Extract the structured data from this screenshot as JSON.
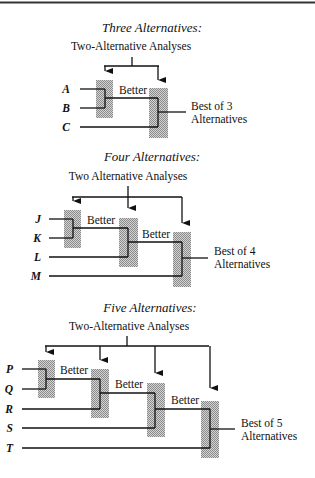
{
  "figure": {
    "width": 315,
    "height": 478,
    "top_rule": {
      "x1": 0,
      "x2": 315,
      "y": 2.5
    },
    "colors": {
      "line": "#111111",
      "shade": "#b8b8b8",
      "shade_dot": "#8a8a8a",
      "background": "#ffffff"
    }
  },
  "sections": [
    {
      "title": "Three Alternatives:",
      "title_pos": {
        "x": 152,
        "y": 32
      },
      "subtitle": "Two-Alternative Analyses",
      "subtitle_pos": {
        "x": 131,
        "y": 50
      },
      "stem": {
        "x": 132,
        "y1": 57,
        "y2": 66
      },
      "bus": {
        "x1": 104,
        "x2": 159,
        "y": 66
      },
      "inputs": [
        {
          "label": "A",
          "y": 89,
          "label_x": 70,
          "line_x1": 80
        },
        {
          "label": "B",
          "y": 108,
          "label_x": 70,
          "line_x1": 80
        },
        {
          "label": "C",
          "y": 127,
          "label_x": 70,
          "line_x1": 80
        }
      ],
      "comparators": [
        {
          "box": {
            "x": 96,
            "y": 80,
            "w": 17,
            "h": 38
          },
          "vx": 105,
          "top_y": 89,
          "bottom_y": 108,
          "out_y": 98,
          "arrow_tip_y": 78,
          "better_label": "Better",
          "better_pos": {
            "x": 119,
            "y": 94
          }
        },
        {
          "box": {
            "x": 149,
            "y": 88,
            "w": 19,
            "h": 50
          },
          "vx": 158,
          "top_y": 98,
          "bottom_y": 127,
          "out_y": 112,
          "arrow_tip_y": 87
        }
      ],
      "output": {
        "x2": 186,
        "label_line1": "Best of 3",
        "label_line2": "Alternatives",
        "label_x": 191,
        "label_y1": 110,
        "label_y2": 123
      }
    },
    {
      "title": "Four Alternatives:",
      "title_pos": {
        "x": 152,
        "y": 161
      },
      "subtitle": "Two Alternative Analyses",
      "subtitle_pos": {
        "x": 128,
        "y": 180
      },
      "stem": {
        "x": 128,
        "y1": 186,
        "y2": 197
      },
      "bus": {
        "x1": 72,
        "x2": 182,
        "y": 197
      },
      "inputs": [
        {
          "label": "J",
          "y": 219,
          "label_x": 41,
          "line_x1": 49
        },
        {
          "label": "K",
          "y": 238,
          "label_x": 41,
          "line_x1": 49
        },
        {
          "label": "L",
          "y": 257,
          "label_x": 41,
          "line_x1": 49
        },
        {
          "label": "M",
          "y": 276,
          "label_x": 41,
          "line_x1": 49
        }
      ],
      "comparators": [
        {
          "box": {
            "x": 64,
            "y": 210,
            "w": 17,
            "h": 38
          },
          "vx": 73,
          "top_y": 219,
          "bottom_y": 238,
          "out_y": 228,
          "arrow_tip_y": 208,
          "better_label": "Better",
          "better_pos": {
            "x": 87,
            "y": 224
          }
        },
        {
          "box": {
            "x": 119,
            "y": 218,
            "w": 19,
            "h": 49
          },
          "vx": 128,
          "top_y": 228,
          "bottom_y": 257,
          "out_y": 242,
          "arrow_tip_y": 215,
          "better_label": "Better",
          "better_pos": {
            "x": 142,
            "y": 238
          }
        },
        {
          "box": {
            "x": 173,
            "y": 232,
            "w": 18,
            "h": 55
          },
          "vx": 182,
          "top_y": 242,
          "bottom_y": 276,
          "out_y": 258,
          "arrow_tip_y": 230
        }
      ],
      "output": {
        "x2": 208,
        "label_line1": "Best of 4",
        "label_line2": "Alternatives",
        "label_x": 214,
        "label_y1": 255,
        "label_y2": 268
      }
    },
    {
      "title": "Five Alternatives:",
      "title_pos": {
        "x": 150,
        "y": 312
      },
      "subtitle": "Two-Alternative Analyses",
      "subtitle_pos": {
        "x": 129,
        "y": 330
      },
      "stem": {
        "x": 127,
        "y1": 336,
        "y2": 346
      },
      "bus": {
        "x1": 45,
        "x2": 209,
        "y": 346
      },
      "inputs": [
        {
          "label": "P",
          "y": 369,
          "label_x": 13,
          "line_x1": 22
        },
        {
          "label": "Q",
          "y": 389,
          "label_x": 13,
          "line_x1": 22
        },
        {
          "label": "R",
          "y": 409,
          "label_x": 13,
          "line_x1": 22
        },
        {
          "label": "S",
          "y": 428,
          "label_x": 13,
          "line_x1": 22
        },
        {
          "label": "T",
          "y": 448,
          "label_x": 13,
          "line_x1": 22
        }
      ],
      "comparators": [
        {
          "box": {
            "x": 38,
            "y": 360,
            "w": 17,
            "h": 38
          },
          "vx": 46,
          "top_y": 369,
          "bottom_y": 389,
          "out_y": 379,
          "arrow_tip_y": 359,
          "better_label": "Better",
          "better_pos": {
            "x": 60,
            "y": 374
          }
        },
        {
          "box": {
            "x": 91,
            "y": 369,
            "w": 18,
            "h": 49
          },
          "vx": 100,
          "top_y": 379,
          "bottom_y": 409,
          "out_y": 393,
          "arrow_tip_y": 367,
          "better_label": "Better",
          "better_pos": {
            "x": 115,
            "y": 388
          }
        },
        {
          "box": {
            "x": 147,
            "y": 383,
            "w": 18,
            "h": 54
          },
          "vx": 155,
          "top_y": 393,
          "bottom_y": 428,
          "out_y": 409,
          "arrow_tip_y": 380,
          "better_label": "Better",
          "better_pos": {
            "x": 171,
            "y": 404
          }
        },
        {
          "box": {
            "x": 201,
            "y": 401,
            "w": 18,
            "h": 57
          },
          "vx": 210,
          "top_y": 409,
          "bottom_y": 448,
          "out_y": 429,
          "arrow_tip_y": 395
        }
      ],
      "output": {
        "x2": 235,
        "label_line1": "Best of 5",
        "label_line2": "Alternatives",
        "label_x": 241,
        "label_y1": 427,
        "label_y2": 440
      }
    }
  ]
}
